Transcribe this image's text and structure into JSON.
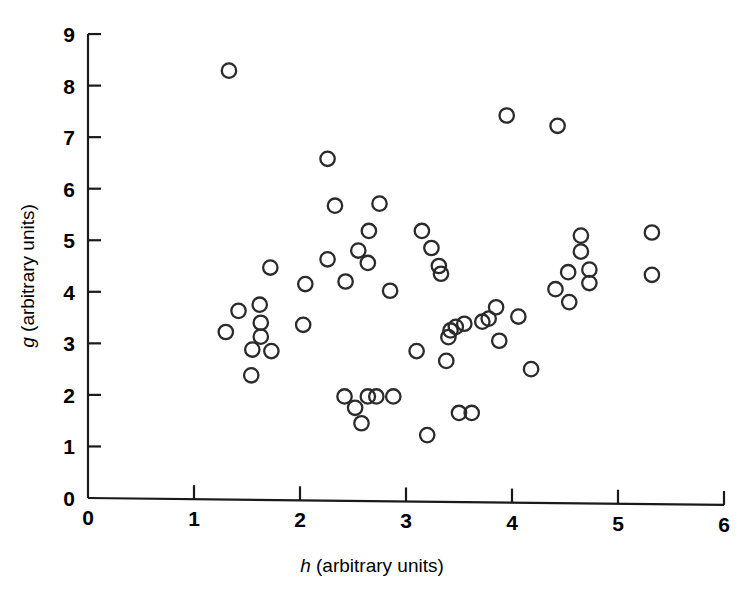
{
  "chart_data": {
    "type": "scatter",
    "title": "",
    "subtitle": "",
    "xlabel_var": "h",
    "xlabel_rest": " (arbitrary units)",
    "xlabel": "h (arbitrary units)",
    "ylabel_var": "g",
    "ylabel_rest": " (arbitrary units)",
    "ylabel": "g (arbitrary units)",
    "xlim": [
      0,
      6
    ],
    "ylim": [
      0,
      9
    ],
    "xticks": [
      "0",
      "1",
      "2",
      "3",
      "4",
      "5",
      "6"
    ],
    "yticks": [
      "0",
      "1",
      "2",
      "3",
      "4",
      "5",
      "6",
      "7",
      "8",
      "9"
    ],
    "xtick_values": [
      0,
      1,
      2,
      3,
      4,
      5,
      6
    ],
    "ytick_values": [
      0,
      1,
      2,
      3,
      4,
      5,
      6,
      7,
      8,
      9
    ],
    "grid": false,
    "legend": null,
    "marker": "open-circle",
    "marker_color": "#2b2b2b",
    "marker_fill": "none",
    "n_points": 57,
    "points": [
      [
        1.33,
        8.29
      ],
      [
        1.3,
        3.22
      ],
      [
        1.42,
        3.63
      ],
      [
        1.62,
        3.75
      ],
      [
        1.63,
        3.4
      ],
      [
        1.63,
        3.13
      ],
      [
        1.72,
        4.47
      ],
      [
        1.55,
        2.88
      ],
      [
        1.73,
        2.85
      ],
      [
        1.54,
        2.38
      ],
      [
        2.03,
        3.36
      ],
      [
        2.05,
        4.15
      ],
      [
        2.26,
        6.58
      ],
      [
        2.33,
        5.67
      ],
      [
        2.55,
        4.8
      ],
      [
        2.64,
        4.56
      ],
      [
        2.65,
        5.18
      ],
      [
        2.43,
        4.2
      ],
      [
        2.75,
        5.71
      ],
      [
        2.85,
        4.02
      ],
      [
        2.42,
        1.97
      ],
      [
        2.52,
        1.75
      ],
      [
        2.58,
        1.45
      ],
      [
        2.64,
        1.97
      ],
      [
        2.72,
        1.97
      ],
      [
        2.88,
        1.97
      ],
      [
        3.1,
        2.85
      ],
      [
        3.15,
        5.18
      ],
      [
        3.24,
        4.85
      ],
      [
        3.33,
        4.35
      ],
      [
        3.31,
        4.5
      ],
      [
        3.2,
        1.22
      ],
      [
        3.38,
        2.66
      ],
      [
        3.4,
        3.12
      ],
      [
        3.42,
        3.25
      ],
      [
        3.47,
        3.32
      ],
      [
        3.5,
        1.65
      ],
      [
        3.62,
        1.65
      ],
      [
        3.55,
        3.38
      ],
      [
        3.72,
        3.42
      ],
      [
        3.78,
        3.48
      ],
      [
        3.85,
        3.7
      ],
      [
        3.95,
        7.42
      ],
      [
        3.88,
        3.05
      ],
      [
        4.06,
        3.52
      ],
      [
        4.43,
        7.22
      ],
      [
        4.18,
        2.5
      ],
      [
        4.41,
        4.05
      ],
      [
        4.53,
        4.38
      ],
      [
        4.65,
        5.09
      ],
      [
        4.65,
        4.78
      ],
      [
        4.73,
        4.43
      ],
      [
        4.73,
        4.17
      ],
      [
        4.54,
        3.8
      ],
      [
        5.32,
        5.15
      ],
      [
        5.32,
        4.33
      ],
      [
        2.26,
        4.63
      ]
    ]
  },
  "axes": {
    "x_axis_name": "x-axis",
    "y_axis_name": "y-axis"
  }
}
